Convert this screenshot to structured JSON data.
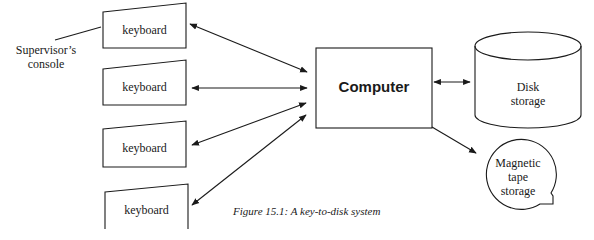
{
  "diagram": {
    "caption": "Figure 15.1: A key-to-disk system",
    "supervisor_label_line1": "Supervisor’s",
    "supervisor_label_line2": "console",
    "keyboards": [
      {
        "label": "keyboard"
      },
      {
        "label": "keyboard"
      },
      {
        "label": "keyboard"
      },
      {
        "label": "keyboard"
      }
    ],
    "computer": {
      "label": "Computer"
    },
    "disk": {
      "line1": "Disk",
      "line2": "storage"
    },
    "tape": {
      "line1": "Magnetic",
      "line2": "tape",
      "line3": "storage"
    },
    "colors": {
      "stroke": "#1a1a1a",
      "background": "#ffffff"
    }
  }
}
